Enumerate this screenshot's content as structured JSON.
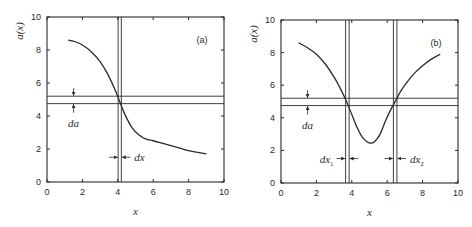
{
  "chart_data": [
    {
      "type": "line",
      "panel_label": "(a)",
      "xlabel": "x",
      "ylabel": "a(x)",
      "xlim": [
        0,
        10
      ],
      "ylim": [
        0,
        10
      ],
      "xticks": [
        0,
        2,
        4,
        6,
        8,
        10
      ],
      "yticks": [
        0,
        2,
        4,
        6,
        8,
        10
      ],
      "grid": false,
      "series": [
        {
          "name": "a(x)",
          "x": [
            1.2,
            1.6,
            2.0,
            2.5,
            3.0,
            3.4,
            3.8,
            4.1,
            4.4,
            4.8,
            5.2,
            5.6,
            6.0,
            6.5,
            7.0,
            7.5,
            8.0,
            8.5,
            9.0
          ],
          "y": [
            8.6,
            8.5,
            8.3,
            7.9,
            7.3,
            6.6,
            5.7,
            4.9,
            4.1,
            3.3,
            2.85,
            2.6,
            2.5,
            2.35,
            2.2,
            2.05,
            1.9,
            1.8,
            1.7
          ]
        }
      ],
      "annotations": {
        "h_lines": [
          5.2,
          4.75
        ],
        "v_lines": [
          4.02,
          4.2
        ],
        "da_label": "da",
        "da_arrow_x": 1.5,
        "dx_label": "dx",
        "dx_arrow_y": 1.5
      }
    },
    {
      "type": "line",
      "panel_label": "(b)",
      "xlabel": "x",
      "ylabel": "a(x)",
      "xlim": [
        0,
        10
      ],
      "ylim": [
        0,
        10
      ],
      "xticks": [
        0,
        2,
        4,
        6,
        8,
        10
      ],
      "yticks": [
        0,
        2,
        4,
        6,
        8,
        10
      ],
      "grid": false,
      "series": [
        {
          "name": "a(x)",
          "x": [
            1.0,
            1.5,
            2.0,
            2.5,
            3.0,
            3.4,
            3.7,
            4.0,
            4.3,
            4.6,
            4.9,
            5.1,
            5.3,
            5.6,
            5.9,
            6.2,
            6.5,
            6.8,
            7.2,
            7.6,
            8.0,
            8.5,
            9.0
          ],
          "y": [
            8.6,
            8.3,
            7.9,
            7.3,
            6.5,
            5.7,
            5.0,
            4.2,
            3.4,
            2.8,
            2.5,
            2.45,
            2.55,
            3.0,
            3.8,
            4.5,
            5.1,
            5.7,
            6.3,
            6.8,
            7.2,
            7.6,
            7.9
          ]
        }
      ],
      "annotations": {
        "h_lines": [
          5.2,
          4.75
        ],
        "v_lines": [
          3.65,
          3.85,
          6.35,
          6.55
        ],
        "da_label": "da",
        "da_arrow_x": 1.5,
        "dx1_label": "dx",
        "dx1_sub": "1",
        "dx2_label": "dx",
        "dx2_sub": "2",
        "dx_arrow_y": 1.5
      }
    }
  ]
}
